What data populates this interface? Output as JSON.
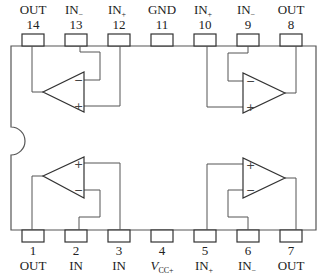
{
  "diagram": {
    "type": "IC pinout",
    "package": "14-pin DIP",
    "top_pins": [
      {
        "number": "14",
        "name": "OUT",
        "sub": ""
      },
      {
        "number": "13",
        "name": "IN",
        "sub": "−"
      },
      {
        "number": "12",
        "name": "IN",
        "sub": "+"
      },
      {
        "number": "11",
        "name": "GND",
        "sub": ""
      },
      {
        "number": "10",
        "name": "IN",
        "sub": "+"
      },
      {
        "number": "9",
        "name": "IN",
        "sub": "−"
      },
      {
        "number": "8",
        "name": "OUT",
        "sub": ""
      }
    ],
    "bottom_pins": [
      {
        "number": "1",
        "name": "OUT",
        "sub": ""
      },
      {
        "number": "2",
        "name": "IN",
        "sub": ""
      },
      {
        "number": "3",
        "name": "IN",
        "sub": ""
      },
      {
        "number": "4",
        "name": "V",
        "sub": "CC+"
      },
      {
        "number": "5",
        "name": "IN",
        "sub": "+"
      },
      {
        "number": "6",
        "name": "IN",
        "sub": "−"
      },
      {
        "number": "7",
        "name": "OUT",
        "sub": ""
      }
    ],
    "amplifiers": [
      {
        "id": "top-left",
        "minus": "−",
        "plus": "+"
      },
      {
        "id": "top-right",
        "minus": "−",
        "plus": "+"
      },
      {
        "id": "bottom-left",
        "minus": "−",
        "plus": "+"
      },
      {
        "id": "bottom-right",
        "minus": "−",
        "plus": "+"
      }
    ]
  }
}
